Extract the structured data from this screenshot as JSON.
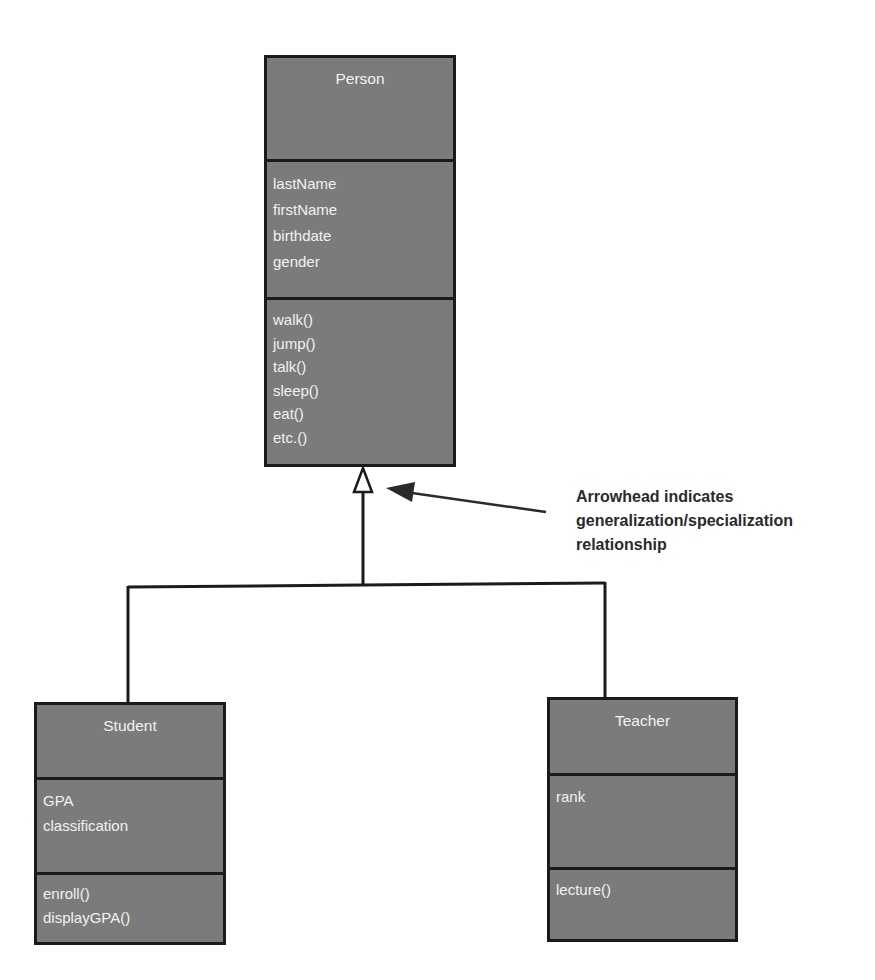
{
  "diagram": {
    "type": "UML class diagram - generalization/specialization",
    "classes": {
      "person": {
        "name": "Person",
        "attributes": [
          "lastName",
          "firstName",
          "birthdate",
          "gender"
        ],
        "methods": [
          "walk()",
          "jump()",
          "talk()",
          "sleep()",
          "eat()",
          "etc.()"
        ]
      },
      "student": {
        "name": "Student",
        "attributes": [
          "GPA",
          "classification"
        ],
        "methods": [
          "enroll()",
          "displayGPA()"
        ]
      },
      "teacher": {
        "name": "Teacher",
        "attributes": [
          "rank"
        ],
        "methods": [
          "lecture()"
        ]
      }
    },
    "relationships": [
      {
        "type": "generalization",
        "from": "Student",
        "to": "Person"
      },
      {
        "type": "generalization",
        "from": "Teacher",
        "to": "Person"
      }
    ],
    "annotation": {
      "lines": [
        "Arrowhead indicates",
        "generalization/specialization",
        "relationship"
      ]
    },
    "colors": {
      "box_fill": "#7b7b7b",
      "box_border": "#1b1b1b",
      "box_text": "#f2f2f2",
      "annotation_text": "#2a2a2a",
      "line": "#1b1b1b"
    }
  }
}
